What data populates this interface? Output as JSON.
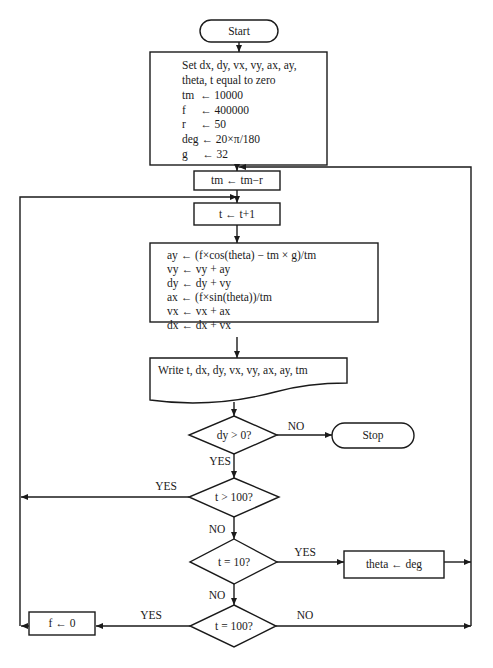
{
  "flowchart": {
    "start": {
      "label": "Start"
    },
    "init": {
      "lines": [
        "Set dx, dy, vx, vy, ax, ay,",
        "theta, t equal to zero",
        "tm  ← 10000",
        "f     ← 400000",
        "r     ← 50",
        "deg ← 20×π/180",
        "g     ← 32"
      ]
    },
    "mass_update": {
      "label": "tm ← tm−r"
    },
    "time_step": {
      "label": "t ← t+1"
    },
    "physics": {
      "lines": [
        "ay ← (f×cos(theta) − tm × g)/tm",
        "vy ← vy + ay",
        "dy ← dy + vy",
        "ax ← (f×sin(theta))/tm",
        "vx ← vx + ax",
        "dx ← dx + vx"
      ]
    },
    "output": {
      "label": "Write t, dx, dy, vx, vy, ax, ay, tm"
    },
    "decision_dy": {
      "label": "dy > 0?",
      "yes": "YES",
      "no": "NO"
    },
    "stop": {
      "label": "Stop"
    },
    "decision_t_gt_100": {
      "label": "t > 100?",
      "yes": "YES",
      "no": "NO"
    },
    "decision_t_eq_10": {
      "label": "t = 10?",
      "yes": "YES",
      "no": "NO"
    },
    "set_theta": {
      "label": "theta ← deg"
    },
    "decision_t_eq_100": {
      "label": "t = 100?",
      "yes": "YES",
      "no": "NO"
    },
    "cut_thrust": {
      "label": "f ← 0"
    }
  }
}
